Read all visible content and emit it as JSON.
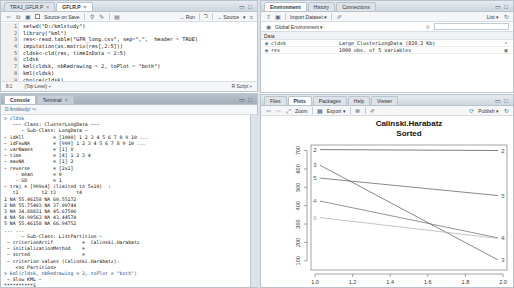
{
  "editor": {
    "tabs": [
      {
        "label": "TRAJ_GFLR.P",
        "active": false
      },
      {
        "label": "GFLR.P",
        "active": true
      }
    ],
    "toolbar": {
      "source_on_save": "Source on Save",
      "run": "→ Run",
      "rerun": "⮌",
      "source": "→ Source"
    },
    "lines": [
      {
        "n": "1",
        "code": "setwd(\"D:/kmlstudy\")"
      },
      {
        "n": "2",
        "code": "library(\"kml\")"
      },
      {
        "n": "3",
        "code": "res<-read.table(\"GFR_long.csv\", sep=\",\",  header = TRUE)"
      },
      {
        "n": "4",
        "code": "imputation(as.matrix(res[,2:5]))"
      },
      {
        "n": "5",
        "code": "cldsk<-cld(res, timeInData = 2:5)"
      },
      {
        "n": "6",
        "code": "cldsk"
      },
      {
        "n": "7",
        "code": "kml(cldsk, nbRedrawing = 2, toPlot = \"both\")"
      },
      {
        "n": "8",
        "code": "kml(cldsk)"
      },
      {
        "n": "9",
        "code": "choice(cldsk)"
      }
    ],
    "status": {
      "position": "8:1",
      "scope": "(Top Level) ÷",
      "type": "R Script ÷"
    }
  },
  "console": {
    "tabs": [
      {
        "label": "Console",
        "active": true
      },
      {
        "label": "Terminal",
        "active": false
      }
    ],
    "path": "D:/kmlstudy/ ⇨",
    "lines": [
      "> cldsk",
      "   ~~~ Class: ClusterLongData ~~~",
      "      ~ Sub-Class: LongData ~",
      "~ idAll          = [1000] 1 2 3 4 5 6 7 8 9 10 ...",
      "~ idFewNA        = [999] 1 2 3 4 5 6 7 8 9 10 ...",
      "~ varNames       = [1] V",
      "~ time           = [4] 1 2 3 4",
      "~ maxNA          = [1] 2",
      "~ reverse        = [2x1]",
      "    - mean       = 0",
      "    - SD         = 1",
      "",
      "~ traj = [999x4] (limited to 5x10)  :",
      "   t1        t2 t3       t4",
      "1 NA 55.46158 NA 60.55172",
      "2 NA 55.75403 NA 37.00744",
      "3 NA 34.88831 NA 45.67506",
      "4 NA 50.90563 NA 43.44574",
      "5 NA 55.46158 NA 66.94752",
      "... ...",
      "",
      "      ~ Sub-Class: ListPartition ~",
      " ~ criterionActif          =  Calinski.Harabatz",
      " ~ initializationMethod    =",
      " ~ sorted                  =",
      " ~ criterion values (Calinski.Harabatz):",
      "    <no Partition>",
      "> kml(cldsk, nbRedrawing = 2, toPlot = \"both\")",
      " ~ Slow KML ~",
      "**********S",
      "> |"
    ]
  },
  "environment": {
    "tabs": [
      {
        "label": "Environment",
        "active": true
      },
      {
        "label": "History",
        "active": false
      },
      {
        "label": "Connections",
        "active": false
      }
    ],
    "toolbar": {
      "import": "Import Dataset ▾",
      "view_mode": "List ▾"
    },
    "scope": "Global Environment ▾",
    "search_placeholder": "",
    "section": "Data",
    "rows": [
      {
        "name": "cldsk",
        "value": "Large ClusterLongData (820.2 Kb)",
        "action": "⌕"
      },
      {
        "name": "res",
        "value": "1000 obs. of 5 variables",
        "action": "▦"
      }
    ]
  },
  "files": {
    "tabs": [
      {
        "label": "Files",
        "active": false
      },
      {
        "label": "Plots",
        "active": true
      },
      {
        "label": "Packages",
        "active": false
      },
      {
        "label": "Help",
        "active": false
      },
      {
        "label": "Viewer",
        "active": false
      }
    ],
    "toolbar": {
      "zoom": "Zoom",
      "export": "Export ▾",
      "publish": "Publish ▾"
    }
  },
  "chart_data": {
    "type": "line",
    "title": "Calinski.Harabatz",
    "subtitle": "Sorted",
    "xlabel": "Rerolling",
    "ylabel": "",
    "x": [
      1.0,
      2.0
    ],
    "xticks": [
      "1.0",
      "1.2",
      "1.4",
      "1.6",
      "1.8",
      "2.0"
    ],
    "yticks": [
      "100",
      "200",
      "300",
      "400",
      "500",
      "600",
      "700"
    ],
    "xlim": [
      1.0,
      2.0
    ],
    "ylim": [
      50,
      730
    ],
    "grid": false,
    "series": [
      {
        "name": "2",
        "values": [
          705,
          700
        ],
        "color": "#444444"
      },
      {
        "name": "3",
        "values": [
          620,
          105
        ],
        "color": "#555555"
      },
      {
        "name": "5",
        "values": [
          550,
          455
        ],
        "color": "#555555"
      },
      {
        "name": "4",
        "values": [
          425,
          225
        ],
        "color": "#666666"
      },
      {
        "name": "6",
        "values": [
          335,
          222
        ],
        "color": "#aaaaaa"
      }
    ]
  }
}
